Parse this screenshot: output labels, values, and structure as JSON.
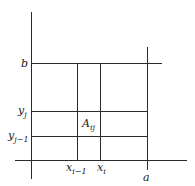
{
  "diagram": {
    "labels": {
      "b": {
        "base": "b",
        "sub": ""
      },
      "y_j": {
        "base": "y",
        "sub": "j"
      },
      "y_j_minus_1": {
        "base": "y",
        "sub": "j−1"
      },
      "x_i_minus_1": {
        "base": "x",
        "sub": "i−1"
      },
      "x_i": {
        "base": "x",
        "sub": "i"
      },
      "a": {
        "base": "a",
        "sub": ""
      },
      "A_ij": {
        "base": "A",
        "sub": "ij"
      }
    },
    "colors": {
      "line": "#2a2a2a",
      "text": "#222222",
      "background": "#ffffff"
    }
  }
}
